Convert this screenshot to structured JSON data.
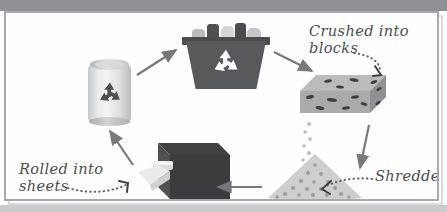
{
  "diagram": {
    "background": "#ffffff",
    "frame_color": "#a7a9ac",
    "band_color": "#8f9194",
    "label_color": "#4b4d50",
    "arrow_color": "#76787b"
  },
  "labels": [
    {
      "id": "crushed",
      "text": "Crushed into\nblocks",
      "leader": "dotted"
    },
    {
      "id": "shredded",
      "text": "Shredded",
      "leader": "dotted"
    },
    {
      "id": "rolled",
      "text": "Rolled into\nsheets",
      "leader": "dotted"
    }
  ],
  "stages": [
    {
      "id": "can",
      "name": "aluminium-can",
      "caption": "",
      "symbol": "recycle-symbol"
    },
    {
      "id": "bin",
      "name": "recycling-bin",
      "caption": "",
      "symbol": "recycle-symbol"
    },
    {
      "id": "block",
      "name": "crushed-block",
      "caption": "Crushed into blocks"
    },
    {
      "id": "pile",
      "name": "shredded-pile",
      "caption": "Shredded"
    },
    {
      "id": "machine",
      "name": "rolling-machine",
      "caption": "Rolled into sheets"
    }
  ],
  "arrows": [
    {
      "id": "can-to-bin",
      "from": "can",
      "to": "bin",
      "direction": "up-right"
    },
    {
      "id": "bin-to-block",
      "from": "bin",
      "to": "block",
      "direction": "down-right"
    },
    {
      "id": "block-to-pile",
      "from": "block",
      "to": "pile",
      "direction": "down"
    },
    {
      "id": "pile-to-machine",
      "from": "pile",
      "to": "machine",
      "direction": "left"
    },
    {
      "id": "machine-to-can",
      "from": "machine",
      "to": "can",
      "direction": "up-left"
    }
  ],
  "colors": {
    "dark_gray": "#57595c",
    "mid_gray": "#8f9194",
    "light_gray": "#d6d7d9",
    "pale_gray": "#eceded"
  }
}
